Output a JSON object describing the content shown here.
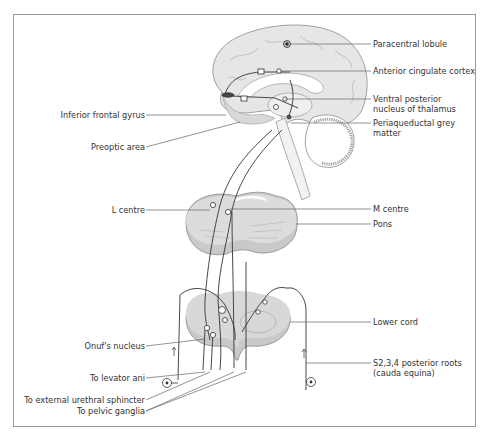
{
  "diagram": {
    "labels_left": {
      "inferior_frontal_gyrus": "Inferior frontal gyrus",
      "preoptic_area": "Preoptic area",
      "l_centre": "L centre",
      "onufs_nucleus": "Onuf's nucleus",
      "to_levator_ani": "To levator ani",
      "to_external_urethral_sphincter": "To external urethral sphincter",
      "to_pelvic_ganglia": "To pelvic ganglia"
    },
    "labels_right": {
      "paracentral_lobule": "Paracentral lobule",
      "anterior_cingulate_cortex": "Anterior cingulate cortex",
      "ventral_posterior_line1": "Ventral posterior",
      "ventral_posterior_line2": "nucleus of thalamus",
      "periaqueductal_line1": "Periaqueductal grey",
      "periaqueductal_line2": "matter",
      "m_centre": "M centre",
      "pons": "Pons",
      "lower_cord": "Lower cord",
      "posterior_roots_line1": "S2,3,4 posterior roots",
      "posterior_roots_line2": "(cauda equina)"
    },
    "colors": {
      "tissue_fill": "#d9d9d9",
      "tissue_dark": "#b8b8b8",
      "outline": "#888888",
      "pathway": "#333333",
      "leader": "#666666"
    }
  }
}
